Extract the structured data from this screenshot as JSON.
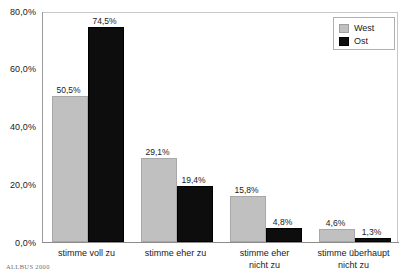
{
  "chart_data": {
    "type": "bar",
    "title": "",
    "xlabel": "",
    "ylabel": "",
    "ylim": [
      0,
      80
    ],
    "grid": false,
    "legend_position": "top-right",
    "categories": [
      "stimme voll zu",
      "stimme eher zu",
      "stimme eher\nnicht zu",
      "stimme überhaupt\nnicht zu"
    ],
    "ytick_labels": [
      "0,0%",
      "20,0%",
      "40,0%",
      "60,0%",
      "80,0%"
    ],
    "ytick_values": [
      0,
      20,
      40,
      60,
      80
    ],
    "series": [
      {
        "name": "West",
        "color": "#c0c0c0",
        "values": [
          50.5,
          29.1,
          15.8,
          4.6
        ],
        "labels": [
          "50,5%",
          "29,1%",
          "15,8%",
          "4,6%"
        ]
      },
      {
        "name": "Ost",
        "color": "#0d0d0d",
        "values": [
          74.5,
          19.4,
          4.8,
          1.3
        ],
        "labels": [
          "74,5%",
          "19,4%",
          "4,8%",
          "1,3%"
        ]
      }
    ]
  },
  "legend": {
    "entries": [
      {
        "label": "West"
      },
      {
        "label": "Ost"
      }
    ]
  },
  "source": {
    "note": "ALLBUS 2000"
  }
}
